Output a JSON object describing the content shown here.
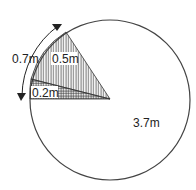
{
  "diagram": {
    "type": "circle-sectors",
    "labels": {
      "arc_length": "0.7m",
      "sector_upper": "0.5m",
      "sector_lower": "0.2m",
      "remainder": "3.7m"
    },
    "colors": {
      "stroke": "#333333",
      "background": "#ffffff"
    }
  }
}
